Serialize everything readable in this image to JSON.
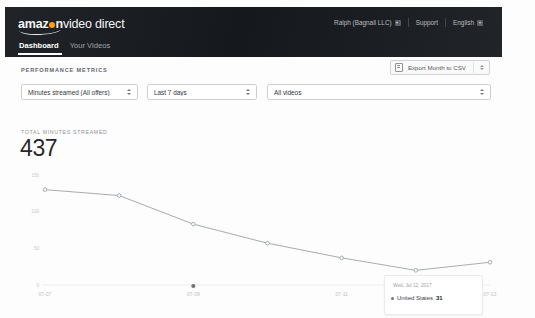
{
  "header": {
    "logo_primary": "amaz",
    "logo_primary_tail": "n",
    "logo_secondary": "video direct",
    "account": "Ralph (Bagnall LLC)",
    "support": "Support",
    "language": "English",
    "bg_color": "#15191e"
  },
  "tabs": [
    {
      "label": "Dashboard",
      "active": true
    },
    {
      "label": "Your Videos",
      "active": false
    }
  ],
  "section": {
    "title": "PERFORMANCE METRICS",
    "export_label": "Export Month to CSV"
  },
  "filters": [
    {
      "name": "metric",
      "value": "Minutes streamed (All offers)"
    },
    {
      "name": "range",
      "value": "Last 7 days"
    },
    {
      "name": "videos",
      "value": "All videos"
    }
  ],
  "summary": {
    "label": "TOTAL MINUTES STREAMED",
    "value": "437"
  },
  "tooltip": {
    "date": "Wed, Jul 12, 2017",
    "series": "United States",
    "value": "31"
  },
  "chart_data": {
    "type": "line",
    "title": "",
    "xlabel": "",
    "ylabel": "",
    "x": [
      "07-07",
      "07-08",
      "07-09",
      "07-10",
      "07-11",
      "07-12",
      "07-13"
    ],
    "xticks": [
      "07-07",
      "07-09",
      "07-11",
      "07-13"
    ],
    "yticks": [
      0,
      50,
      100,
      150
    ],
    "ylim": [
      0,
      150
    ],
    "grid": false,
    "legend": "none",
    "series": [
      {
        "name": "United States",
        "color": "#9aa0a4",
        "values": [
          130,
          122,
          83,
          57,
          37,
          20,
          31
        ]
      }
    ],
    "highlight_index": 5,
    "highlight_value": 31
  }
}
